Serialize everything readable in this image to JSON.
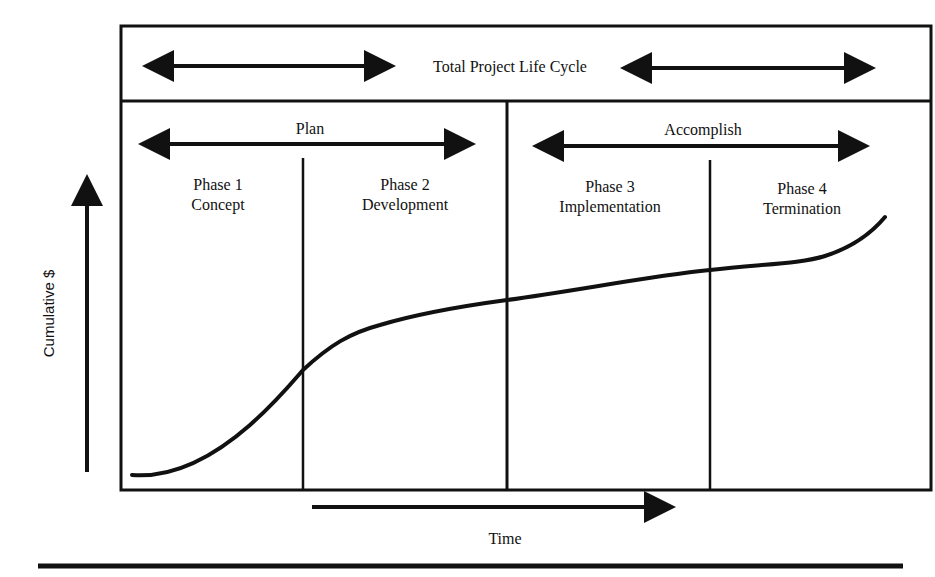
{
  "diagram": {
    "header": {
      "title": "Total Project Life Cycle"
    },
    "groups": [
      {
        "label": "Plan"
      },
      {
        "label": "Accomplish"
      }
    ],
    "phases": [
      {
        "number": "Phase 1",
        "name": "Concept"
      },
      {
        "number": "Phase 2",
        "name": "Development"
      },
      {
        "number": "Phase 3",
        "name": "Implementation"
      },
      {
        "number": "Phase 4",
        "name": "Termination"
      }
    ],
    "axes": {
      "y_label": "Cumulative $",
      "x_label": "Time"
    },
    "curve": {
      "description": "S-curve of cumulative cost over project life cycle",
      "points": [
        [
          132,
          475
        ],
        [
          303,
          370
        ],
        [
          507,
          300
        ],
        [
          710,
          270
        ],
        [
          820,
          258
        ],
        [
          885,
          217
        ]
      ]
    },
    "colors": {
      "line": "#111111",
      "background": "#ffffff"
    }
  }
}
